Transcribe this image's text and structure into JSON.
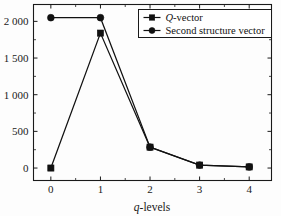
{
  "chart_data": {
    "type": "line",
    "title": "",
    "subtitle": "",
    "xlabel": "q-levels",
    "xlabel_italic_prefix": "q",
    "xlabel_rest": "-levels",
    "ylabel": "",
    "x": [
      0,
      1,
      2,
      3,
      4
    ],
    "xtick_labels": [
      "0",
      "1",
      "2",
      "3",
      "4"
    ],
    "ytick_labels": [
      "0",
      "500",
      "1 000",
      "1 500",
      "2 000"
    ],
    "ytick_values": [
      0,
      500,
      1000,
      1500,
      2000
    ],
    "xlim": [
      -0.35,
      4.45
    ],
    "ylim": [
      -170,
      2230
    ],
    "grid": false,
    "minor_ticks": true,
    "legend_position": "top-right",
    "series": [
      {
        "name": "Q-vector",
        "name_italic_prefix": "Q",
        "name_rest": "-vector",
        "marker": "square",
        "color": "#111111",
        "values": [
          0,
          1840,
          285,
          40,
          15
        ]
      },
      {
        "name": "Second structure vector",
        "marker": "circle",
        "color": "#111111",
        "values": [
          2050,
          2050,
          285,
          40,
          15
        ]
      }
    ]
  },
  "legend": {
    "items": [
      {
        "label": "Q-vector",
        "italic_prefix": "Q",
        "rest": "-vector",
        "marker": "square"
      },
      {
        "label": "Second structure vector",
        "italic_prefix": "",
        "rest": "Second structure vector",
        "marker": "circle"
      }
    ]
  },
  "colors": {
    "ink": "#111111",
    "axis": "#1a1a1a",
    "background": "#fdfdfd"
  }
}
